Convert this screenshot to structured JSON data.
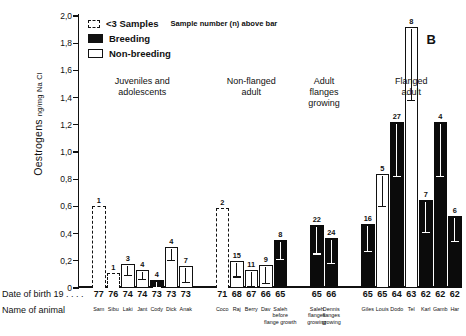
{
  "panel_letter": "B",
  "axis": {
    "y_title_main": "Oestrogens",
    "y_title_sub": "ng/mg  Na Cl",
    "y_ticks": [
      "0",
      "0,2",
      "0,4",
      "0,6",
      "0,8",
      "1,0",
      "1,2",
      "1,4",
      "1,6",
      "1,8",
      "2,0"
    ],
    "row_label_dob": "Date of birth 19 . . . .",
    "row_label_name": "Name of animal"
  },
  "legend": {
    "dashed_label": "<3 Samples",
    "note": "Sample number (n) above bar",
    "breeding_label": "Breeding",
    "nonbreeding_label": "Non-breeding"
  },
  "groups": [
    {
      "title": "Juveniles and\nadolescents"
    },
    {
      "title": "Non-flanged\nadult"
    },
    {
      "title": "Adult\nflanges\ngrowing"
    },
    {
      "title": "Flanged\nadult"
    }
  ],
  "chart_data": {
    "type": "bar",
    "xlabel": "Date of birth / Name of animal",
    "ylabel": "Oestrogens ng/mg Na Cl",
    "ylim": [
      0,
      2.0
    ],
    "ytick_step": 0.2,
    "grid": false,
    "legend_position": "top-left",
    "panel": "B",
    "series_styles": {
      "breeding": "solid black fill",
      "non_breeding": "open white bar",
      "fewer_than_3_samples": "dashed outline"
    },
    "groups": [
      {
        "name": "Juveniles and adolescents",
        "bars": [
          {
            "name": "Sam",
            "dob": "77",
            "n": 1,
            "value": 0.6,
            "style": "dashed",
            "error": null
          },
          {
            "name": "Sibu",
            "dob": "76",
            "n": 1,
            "value": 0.11,
            "style": "dashed",
            "error": null
          },
          {
            "name": "Laki",
            "dob": "74",
            "n": 3,
            "value": 0.18,
            "style": "non_breeding",
            "error": 0.07
          },
          {
            "name": "Jant",
            "dob": "74",
            "n": 4,
            "value": 0.13,
            "style": "non_breeding",
            "error": 0.05
          },
          {
            "name": "Cody",
            "dob": "73",
            "n": 4,
            "value": 0.06,
            "style": "breeding",
            "error": 0.04
          },
          {
            "name": "Dick",
            "dob": "73",
            "n": 4,
            "value": 0.3,
            "style": "non_breeding",
            "error": 0.08
          },
          {
            "name": "Anak",
            "dob": "73",
            "n": 7,
            "value": 0.16,
            "style": "non_breeding",
            "error": 0.1
          }
        ]
      },
      {
        "name": "Non-flanged adult",
        "bars": [
          {
            "name": "Coco",
            "dob": "71",
            "n": 2,
            "value": 0.59,
            "style": "dashed",
            "error": null
          },
          {
            "name": "Raj",
            "dob": "68",
            "n": 15,
            "value": 0.2,
            "style": "non_breeding",
            "error": 0.1
          },
          {
            "name": "Berry",
            "dob": "67",
            "n": 11,
            "value": 0.13,
            "style": "non_breeding",
            "error": 0.1
          },
          {
            "name": "Dav",
            "dob": "66",
            "n": 9,
            "value": 0.17,
            "style": "non_breeding",
            "error": 0.12
          },
          {
            "name": "Saleh",
            "dob": "65",
            "n": 8,
            "value": 0.35,
            "style": "breeding",
            "error": 0.12
          }
        ]
      },
      {
        "name": "Adult flanges growing",
        "bars": [
          {
            "name": "Saleh",
            "dob": "65",
            "n": 22,
            "value": 0.46,
            "style": "breeding",
            "error": 0.19
          },
          {
            "name": "Dennis",
            "dob": "66",
            "n": 24,
            "value": 0.37,
            "style": "breeding",
            "error": 0.17
          }
        ]
      },
      {
        "name": "Flanged adult",
        "bars": [
          {
            "name": "Giles",
            "dob": "65",
            "n": 16,
            "value": 0.47,
            "style": "breeding",
            "error": 0.18
          },
          {
            "name": "Louis",
            "dob": "65",
            "n": 5,
            "value": 0.84,
            "style": "non_breeding",
            "error": 0.22
          },
          {
            "name": "Dodo",
            "dob": "64",
            "n": 27,
            "value": 1.22,
            "style": "breeding",
            "error": 0.38
          },
          {
            "name": "Tel",
            "dob": "63",
            "n": 8,
            "value": 1.92,
            "style": "non_breeding",
            "error": 0.52
          },
          {
            "name": "Karl",
            "dob": "62",
            "n": 7,
            "value": 0.65,
            "style": "breeding",
            "error": 0.22
          },
          {
            "name": "Gamb",
            "dob": "62",
            "n": 4,
            "value": 1.22,
            "style": "breeding",
            "error": 0.38
          },
          {
            "name": "Har",
            "dob": "62",
            "n": 6,
            "value": 0.53,
            "style": "breeding",
            "error": 0.17
          }
        ]
      }
    ],
    "annotations": [
      {
        "text": "before flange growth",
        "attached_to": "Saleh (non-flanged adult)"
      },
      {
        "text": "flanges growing",
        "attached_to": "Saleh/Dennis (adult flanges growing)"
      }
    ]
  }
}
